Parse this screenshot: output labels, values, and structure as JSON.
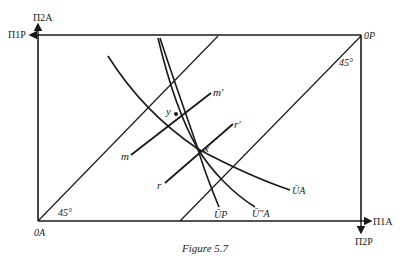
{
  "figure": {
    "caption": "Figure 5.7",
    "axes": {
      "top_left_vertical": "Π2A",
      "top_left_horizontal": "Π1P",
      "bottom_right_horizontal": "Π1A",
      "bottom_right_vertical": "Π2P"
    },
    "origins": {
      "A": "0A",
      "P": "0P"
    },
    "angles": {
      "bottom_left": "45°",
      "top_right": "45°"
    },
    "points": {
      "x": "x",
      "y": "y"
    },
    "lines": {
      "m_start": "m",
      "m_end": "m'",
      "r_start": "r",
      "r_end": "r'"
    },
    "curves": {
      "UP": "ŪP",
      "UA_prime": "Ū″A",
      "UA": "ŪA"
    }
  },
  "colors": {
    "ink": "#1a1a1a",
    "paper": "#ffffff"
  }
}
